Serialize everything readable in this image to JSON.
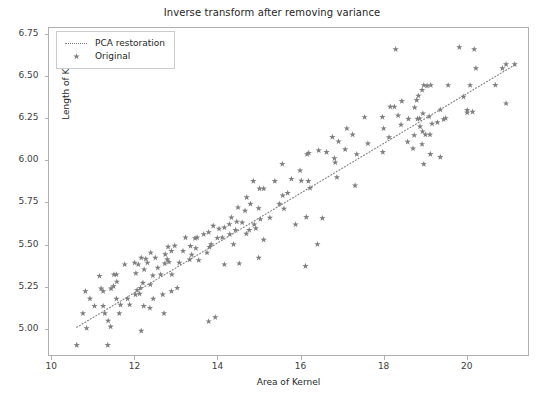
{
  "chart_data": {
    "type": "scatter",
    "title": "Inverse transform after removing variance",
    "xlabel": "Area of Kernel",
    "ylabel": "Length of Kernel",
    "xlim": [
      9.92,
      21.5
    ],
    "ylim": [
      4.84,
      6.79
    ],
    "grid": false,
    "legend_position": "upper left",
    "xticks": [
      10,
      12,
      14,
      16,
      18,
      20
    ],
    "xtick_labels": [
      "10",
      "12",
      "14",
      "16",
      "18",
      "20"
    ],
    "yticks": [
      5.0,
      5.25,
      5.5,
      5.75,
      6.0,
      6.25,
      6.5,
      6.75
    ],
    "ytick_labels": [
      "5.00",
      "5.25",
      "5.50",
      "5.75",
      "6.00",
      "6.25",
      "6.50",
      "6.75"
    ],
    "marker_color": "#7f7f7f",
    "line_color": "#7f7f7f",
    "series": [
      {
        "name": "PCA restoration",
        "type": "line",
        "style": "dotted",
        "x": [
          10.59,
          21.18
        ],
        "y": [
          5.005,
          6.57
        ]
      },
      {
        "name": "Original",
        "type": "scatter",
        "marker": "star",
        "points": [
          [
            10.59,
            4.899
          ],
          [
            10.74,
            5.088
          ],
          [
            10.8,
            5.22
          ],
          [
            10.83,
            5.0
          ],
          [
            10.91,
            5.176
          ],
          [
            11.02,
            5.132
          ],
          [
            11.18,
            5.236
          ],
          [
            11.23,
            5.22
          ],
          [
            11.23,
            5.132
          ],
          [
            11.27,
            5.088
          ],
          [
            11.34,
            4.899
          ],
          [
            11.35,
            5.044
          ],
          [
            11.41,
            5.009
          ],
          [
            11.42,
            5.236
          ],
          [
            11.48,
            5.25
          ],
          [
            11.49,
            5.32
          ],
          [
            11.55,
            5.175
          ],
          [
            11.55,
            5.32
          ],
          [
            11.56,
            5.277
          ],
          [
            11.62,
            5.088
          ],
          [
            11.65,
            5.139
          ],
          [
            11.75,
            5.38
          ],
          [
            11.82,
            5.175
          ],
          [
            11.87,
            5.14
          ],
          [
            11.99,
            5.39
          ],
          [
            12.01,
            5.2
          ],
          [
            12.02,
            5.327
          ],
          [
            12.05,
            5.228
          ],
          [
            12.08,
            5.38
          ],
          [
            12.11,
            5.205
          ],
          [
            12.13,
            5.24
          ],
          [
            12.15,
            5.42
          ],
          [
            12.19,
            5.27
          ],
          [
            12.21,
            5.132
          ],
          [
            12.22,
            5.35
          ],
          [
            12.26,
            5.413
          ],
          [
            12.3,
            5.39
          ],
          [
            12.36,
            5.12
          ],
          [
            12.37,
            5.26
          ],
          [
            12.38,
            5.45
          ],
          [
            12.43,
            5.314
          ],
          [
            12.44,
            5.175
          ],
          [
            12.49,
            5.42
          ],
          [
            12.55,
            5.36
          ],
          [
            12.62,
            5.32
          ],
          [
            12.67,
            5.2
          ],
          [
            12.7,
            5.088
          ],
          [
            12.72,
            5.385
          ],
          [
            12.73,
            5.44
          ],
          [
            12.78,
            5.41
          ],
          [
            12.8,
            5.485
          ],
          [
            12.82,
            5.395
          ],
          [
            12.88,
            5.46
          ],
          [
            12.89,
            5.32
          ],
          [
            12.96,
            5.491
          ],
          [
            13.02,
            5.24
          ],
          [
            13.07,
            5.39
          ],
          [
            13.16,
            5.46
          ],
          [
            13.22,
            5.54
          ],
          [
            13.32,
            5.409
          ],
          [
            13.34,
            5.49
          ],
          [
            13.37,
            5.438
          ],
          [
            13.45,
            5.536
          ],
          [
            13.47,
            5.477
          ],
          [
            13.5,
            5.54
          ],
          [
            13.54,
            5.405
          ],
          [
            13.66,
            5.56
          ],
          [
            13.74,
            5.45
          ],
          [
            13.78,
            5.572
          ],
          [
            13.8,
            5.484
          ],
          [
            13.84,
            5.5
          ],
          [
            13.89,
            5.61
          ],
          [
            13.94,
            5.065
          ],
          [
            13.99,
            5.538
          ],
          [
            14.03,
            5.593
          ],
          [
            14.11,
            5.541
          ],
          [
            14.16,
            5.6
          ],
          [
            14.16,
            5.38
          ],
          [
            14.28,
            5.62
          ],
          [
            14.29,
            5.56
          ],
          [
            14.33,
            5.66
          ],
          [
            14.38,
            5.5
          ],
          [
            14.43,
            5.585
          ],
          [
            14.46,
            5.635
          ],
          [
            14.49,
            5.72
          ],
          [
            14.52,
            5.386
          ],
          [
            14.59,
            5.63
          ],
          [
            14.66,
            5.7
          ],
          [
            14.69,
            5.563
          ],
          [
            14.7,
            5.78
          ],
          [
            14.76,
            5.585
          ],
          [
            14.79,
            5.741
          ],
          [
            14.86,
            5.877
          ],
          [
            14.88,
            5.618
          ],
          [
            14.92,
            5.595
          ],
          [
            14.99,
            5.715
          ],
          [
            15.01,
            5.832
          ],
          [
            15.03,
            5.65
          ],
          [
            15.11,
            5.832
          ],
          [
            15.26,
            5.658
          ],
          [
            15.38,
            5.877
          ],
          [
            15.49,
            5.741
          ],
          [
            15.56,
            5.979
          ],
          [
            15.57,
            5.791
          ],
          [
            15.6,
            5.712
          ],
          [
            15.69,
            5.806
          ],
          [
            15.78,
            5.89
          ],
          [
            15.88,
            5.618
          ],
          [
            15.99,
            5.94
          ],
          [
            16.02,
            5.879
          ],
          [
            16.12,
            5.37
          ],
          [
            16.14,
            5.662
          ],
          [
            16.16,
            6.037
          ],
          [
            16.19,
            5.877
          ],
          [
            16.2,
            6.045
          ],
          [
            16.23,
            5.836
          ],
          [
            16.44,
            6.06
          ],
          [
            16.53,
            5.656
          ],
          [
            16.63,
            6.05
          ],
          [
            16.77,
            6.14
          ],
          [
            16.82,
            6.013
          ],
          [
            16.84,
            5.988
          ],
          [
            16.88,
            5.9
          ],
          [
            16.92,
            6.113
          ],
          [
            17.08,
            6.066
          ],
          [
            17.12,
            6.191
          ],
          [
            17.26,
            6.154
          ],
          [
            17.32,
            5.85
          ],
          [
            17.36,
            6.037
          ],
          [
            17.55,
            6.258
          ],
          [
            17.63,
            6.101
          ],
          [
            17.98,
            6.259
          ],
          [
            18.01,
            6.191
          ],
          [
            18.14,
            6.138
          ],
          [
            18.17,
            6.32
          ],
          [
            18.27,
            6.32
          ],
          [
            18.3,
            6.663
          ],
          [
            18.36,
            6.268
          ],
          [
            18.43,
            6.213
          ],
          [
            18.45,
            6.354
          ],
          [
            18.59,
            6.111
          ],
          [
            18.61,
            6.248
          ],
          [
            18.72,
            6.071
          ],
          [
            18.75,
            6.15
          ],
          [
            18.76,
            6.316
          ],
          [
            18.81,
            6.36
          ],
          [
            18.83,
            6.248
          ],
          [
            18.85,
            6.386
          ],
          [
            18.88,
            6.25
          ],
          [
            18.89,
            6.202
          ],
          [
            18.94,
            6.097
          ],
          [
            18.94,
            6.42
          ],
          [
            18.95,
            6.173
          ],
          [
            18.96,
            6.28
          ],
          [
            18.98,
            6.449
          ],
          [
            19.02,
            6.154
          ],
          [
            19.06,
            6.445
          ],
          [
            19.11,
            6.262
          ],
          [
            19.13,
            6.154
          ],
          [
            19.14,
            6.038
          ],
          [
            19.15,
            6.449
          ],
          [
            19.18,
            6.219
          ],
          [
            19.31,
            6.227
          ],
          [
            19.38,
            6.303
          ],
          [
            19.46,
            6.245
          ],
          [
            19.51,
            6.252
          ],
          [
            19.57,
            6.449
          ],
          [
            19.94,
            6.38
          ],
          [
            20.03,
            6.285
          ],
          [
            20.1,
            6.449
          ],
          [
            20.16,
            6.29
          ],
          [
            20.2,
            6.663
          ],
          [
            20.24,
            6.55
          ],
          [
            20.71,
            6.45
          ],
          [
            20.88,
            6.55
          ],
          [
            20.97,
            6.573
          ],
          [
            21.18,
            6.573
          ],
          [
            20.03,
            6.3
          ],
          [
            19.84,
            6.675
          ],
          [
            18.98,
            5.978
          ],
          [
            17.99,
            6.05
          ],
          [
            15.11,
            5.527
          ],
          [
            13.78,
            5.04
          ],
          [
            12.15,
            4.984
          ],
          [
            11.14,
            5.311
          ],
          [
            12.88,
            5.22
          ],
          [
            14.99,
            5.42
          ],
          [
            16.41,
            5.5
          ],
          [
            19.38,
            6.02
          ],
          [
            20.97,
            6.34
          ]
        ]
      }
    ]
  }
}
